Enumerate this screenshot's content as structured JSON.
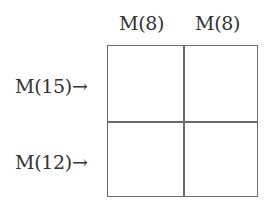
{
  "columns": [
    {
      "label": "M(8)"
    },
    {
      "label": "M(8)"
    }
  ],
  "rows": [
    {
      "label": "M(15)→"
    },
    {
      "label": "M(12)→"
    }
  ],
  "cells": [
    [
      "",
      ""
    ],
    [
      "",
      ""
    ]
  ],
  "colors": {
    "grid_line": "#6a6a6a",
    "text": "#333333",
    "background": "#ffffff"
  }
}
